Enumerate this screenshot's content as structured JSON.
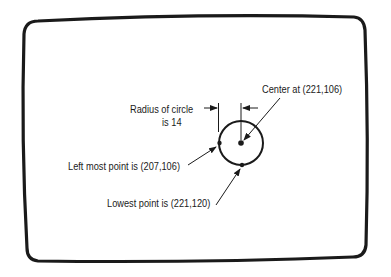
{
  "diagram": {
    "type": "screen-coordinate-illustration",
    "stroke_color": "#1a1a1a",
    "background": "#ffffff",
    "labels": {
      "radius_line1": "Radius of circle",
      "radius_line2": "is 14",
      "center": "Center at (221,106)",
      "leftmost": "Left most point is (207,106)",
      "lowest": "Lowest point is (221,120)"
    },
    "circle": {
      "center": [
        221,
        106
      ],
      "radius": 14,
      "leftmost_point": [
        207,
        106
      ],
      "lowest_point": [
        221,
        120
      ]
    }
  }
}
